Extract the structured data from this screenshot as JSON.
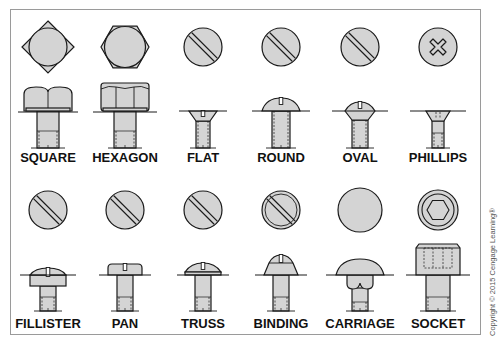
{
  "colors": {
    "fill": "#d4d4d4",
    "stroke": "#1a1a1a",
    "frame": "#9a9a9a"
  },
  "rows": [
    {
      "items": [
        {
          "id": "square",
          "label": "SQUARE",
          "top_icon": "square-head-top-icon",
          "side_icon": "square-head-side-icon"
        },
        {
          "id": "hexagon",
          "label": "HEXAGON",
          "top_icon": "hexagon-head-top-icon",
          "side_icon": "hexagon-head-side-icon"
        },
        {
          "id": "flat",
          "label": "FLAT",
          "top_icon": "slotted-head-top-icon",
          "side_icon": "flat-head-side-icon"
        },
        {
          "id": "round",
          "label": "ROUND",
          "top_icon": "slotted-head-top-icon",
          "side_icon": "round-head-side-icon"
        },
        {
          "id": "oval",
          "label": "OVAL",
          "top_icon": "slotted-head-top-icon",
          "side_icon": "oval-head-side-icon"
        },
        {
          "id": "phillips",
          "label": "PHILLIPS",
          "top_icon": "phillips-head-top-icon",
          "side_icon": "phillips-head-side-icon"
        }
      ]
    },
    {
      "items": [
        {
          "id": "fillister",
          "label": "FILLISTER",
          "top_icon": "slotted-head-top-icon",
          "side_icon": "fillister-head-side-icon"
        },
        {
          "id": "pan",
          "label": "PAN",
          "top_icon": "slotted-head-top-icon",
          "side_icon": "pan-head-side-icon"
        },
        {
          "id": "truss",
          "label": "TRUSS",
          "top_icon": "slotted-head-top-icon",
          "side_icon": "truss-head-side-icon"
        },
        {
          "id": "binding",
          "label": "BINDING",
          "top_icon": "binding-head-top-icon",
          "side_icon": "binding-head-side-icon"
        },
        {
          "id": "carriage",
          "label": "CARRIAGE",
          "top_icon": "carriage-head-top-icon",
          "side_icon": "carriage-head-side-icon"
        },
        {
          "id": "socket",
          "label": "SOCKET",
          "top_icon": "socket-head-top-icon",
          "side_icon": "socket-head-side-icon"
        }
      ]
    }
  ],
  "copyright": "Copyright © 2015 Cengage Learning®"
}
